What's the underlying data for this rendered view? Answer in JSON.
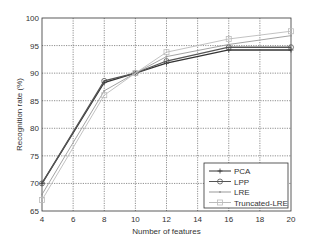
{
  "chart_data": {
    "type": "line",
    "title": "",
    "xlabel": "Number of features",
    "ylabel": "Recognition rate (%)",
    "xlim": [
      4,
      20
    ],
    "ylim": [
      65,
      100
    ],
    "xticks": [
      4,
      6,
      8,
      10,
      12,
      14,
      16,
      18,
      20
    ],
    "yticks": [
      65,
      70,
      75,
      80,
      85,
      90,
      95,
      100
    ],
    "grid": true,
    "legend_position": "lower right",
    "x": [
      4,
      8,
      10,
      12,
      16,
      20
    ],
    "series": [
      {
        "name": "PCA",
        "values": [
          70.0,
          88.3,
          90.0,
          91.8,
          94.2,
          94.2
        ],
        "color": "#333333",
        "marker": "+"
      },
      {
        "name": "LPP",
        "values": [
          70.0,
          88.6,
          90.0,
          92.2,
          94.7,
          94.7
        ],
        "color": "#555555",
        "marker": "o"
      },
      {
        "name": "LRE",
        "values": [
          68.0,
          86.8,
          90.0,
          93.0,
          95.2,
          96.8
        ],
        "color": "#999999",
        "marker": "."
      },
      {
        "name": "Truncated-LRE",
        "values": [
          67.0,
          86.0,
          90.0,
          93.8,
          96.2,
          97.6
        ],
        "color": "#bbbbbb",
        "marker": "s"
      }
    ]
  }
}
